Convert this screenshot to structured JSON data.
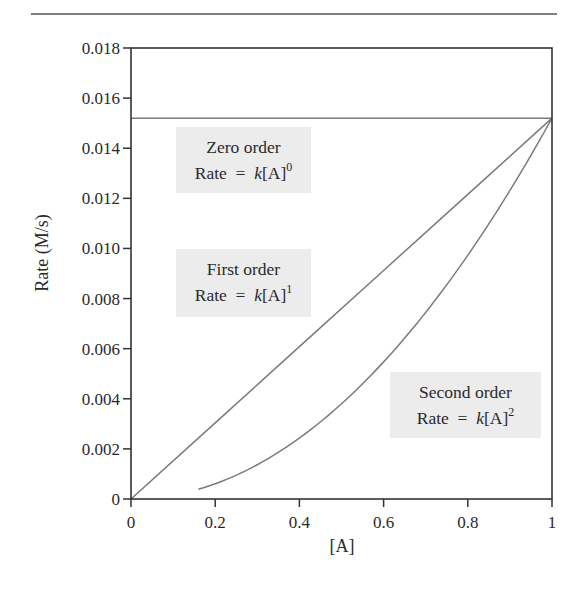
{
  "chart_data": {
    "type": "line",
    "title": "",
    "xlabel": "[A]",
    "ylabel": "Rate (M/s)",
    "xlim": [
      0,
      1
    ],
    "ylim": [
      0,
      0.018
    ],
    "grid": false,
    "legend": "none (inline annotation boxes)",
    "x_ticks": [
      0,
      0.2,
      0.4,
      0.6,
      0.8,
      1
    ],
    "x_tick_labels": [
      "0",
      "0.2",
      "0.4",
      "0.6",
      "0.8",
      "1"
    ],
    "y_ticks": [
      0,
      0.002,
      0.004,
      0.006,
      0.008,
      0.01,
      0.012,
      0.014,
      0.016,
      0.018
    ],
    "y_tick_labels": [
      "0",
      "0.002",
      "0.004",
      "0.006",
      "0.008",
      "0.010",
      "0.012",
      "0.014",
      "0.016",
      "0.018"
    ],
    "series": [
      {
        "name": "Zero order",
        "equation": "Rate = k[A]^0",
        "x": [
          0,
          0.2,
          0.4,
          0.6,
          0.8,
          1.0
        ],
        "values": [
          0.0152,
          0.0152,
          0.0152,
          0.0152,
          0.0152,
          0.0152
        ]
      },
      {
        "name": "First order",
        "equation": "Rate = k[A]^1",
        "x": [
          0,
          0.2,
          0.4,
          0.6,
          0.8,
          1.0
        ],
        "values": [
          0,
          0.00304,
          0.00608,
          0.00912,
          0.01216,
          0.0152
        ]
      },
      {
        "name": "Second order",
        "equation": "Rate = k[A]^2",
        "x": [
          0.16,
          0.2,
          0.3,
          0.4,
          0.5,
          0.6,
          0.7,
          0.8,
          0.9,
          1.0
        ],
        "values": [
          0.00039,
          0.00061,
          0.00137,
          0.00243,
          0.0038,
          0.00547,
          0.00745,
          0.00973,
          0.01231,
          0.0152
        ]
      }
    ],
    "annotations": [
      {
        "title": "Zero order",
        "prefix": "Rate = ",
        "k": "k",
        "bracket": "[A]",
        "exponent": "0"
      },
      {
        "title": "First order",
        "prefix": "Rate = ",
        "k": "k",
        "bracket": "[A]",
        "exponent": "1"
      },
      {
        "title": "Second order",
        "prefix": "Rate = ",
        "k": "k",
        "bracket": "[A]",
        "exponent": "2"
      }
    ]
  },
  "colors": {
    "axis": "#333333",
    "series_line": "#7a7a7a",
    "annotation_box": "#ececec",
    "text": "#2a2a2a"
  }
}
